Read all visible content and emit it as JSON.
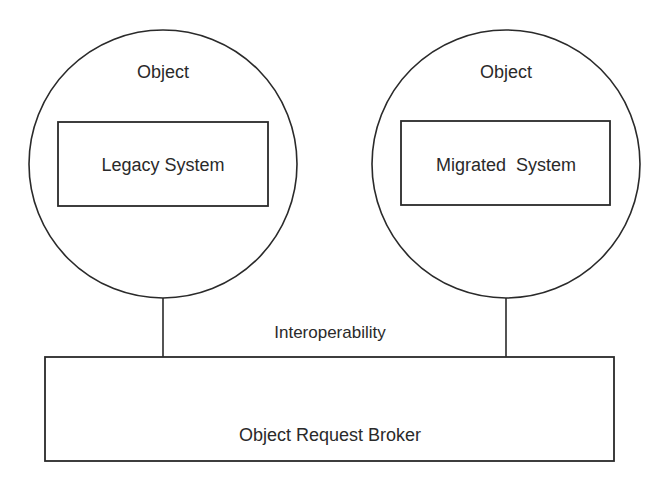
{
  "diagram": {
    "colors": {
      "stroke": "#2a2a2a",
      "background": "#ffffff",
      "text": "#2a2a2a"
    },
    "objects": [
      {
        "title": "Object",
        "system_label": "Legacy System"
      },
      {
        "title": "Object",
        "system_label": "Migrated  System"
      }
    ],
    "connector_label": "Interoperability",
    "broker_label": "Object Request Broker"
  }
}
